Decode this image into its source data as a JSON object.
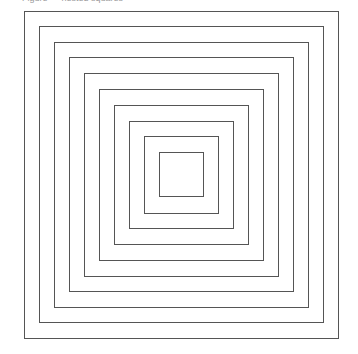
{
  "caption": {
    "text": "Figure — nested squares",
    "clipped": true
  },
  "diagram": {
    "type": "nested-squares",
    "count": 10,
    "stroke_color": "#555555",
    "background": "#ffffff",
    "squares": [
      {
        "left": 24,
        "top": 11,
        "right": 338,
        "bottom": 338
      },
      {
        "left": 39,
        "top": 26,
        "right": 323,
        "bottom": 322
      },
      {
        "left": 54,
        "top": 42,
        "right": 308,
        "bottom": 307
      },
      {
        "left": 69,
        "top": 57,
        "right": 293,
        "bottom": 291
      },
      {
        "left": 84,
        "top": 73,
        "right": 278,
        "bottom": 276
      },
      {
        "left": 99,
        "top": 89,
        "right": 263,
        "bottom": 260
      },
      {
        "left": 114,
        "top": 105,
        "right": 248,
        "bottom": 244
      },
      {
        "left": 129,
        "top": 121,
        "right": 233,
        "bottom": 228
      },
      {
        "left": 144,
        "top": 136,
        "right": 218,
        "bottom": 213
      },
      {
        "left": 159,
        "top": 152,
        "right": 203,
        "bottom": 196
      }
    ]
  }
}
